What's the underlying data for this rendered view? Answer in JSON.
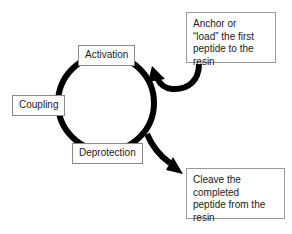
{
  "diagram": {
    "background_color": "#ffffff",
    "stroke_color": "#000000",
    "box_border_color": "#8a8a8a",
    "text_color": "#1a1a1a"
  },
  "cycle": {
    "stages": [
      {
        "id": "activation",
        "label": "Activation"
      },
      {
        "id": "coupling",
        "label": "Coupling"
      },
      {
        "id": "deprotection",
        "label": "Deprotection"
      }
    ],
    "ring": {
      "center_x": 106,
      "center_y": 103,
      "radius": 48,
      "stroke_width": 6,
      "direction": "clockwise"
    }
  },
  "notes": [
    {
      "id": "anchor-note",
      "text": "Anchor or\n“load” the first\npeptide to the\nresin",
      "position": "top-right",
      "arrow": "into-cycle"
    },
    {
      "id": "cleave-note",
      "text": "Cleave the\ncompleted\npeptide from the\nresin",
      "position": "bottom-right",
      "arrow": "out-of-cycle"
    }
  ],
  "arrows": [
    {
      "id": "entry-arrow",
      "from": "anchor-note",
      "to": "cycle",
      "head": "up-left"
    },
    {
      "id": "exit-arrow",
      "from": "cycle",
      "to": "cleave-note",
      "head": "down-right"
    }
  ]
}
